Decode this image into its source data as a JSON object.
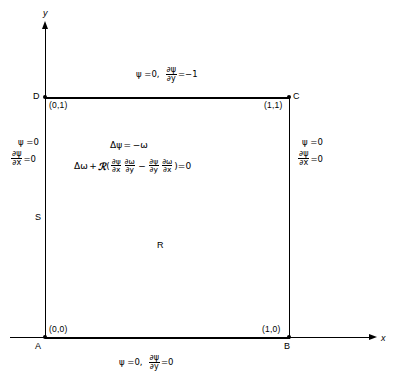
{
  "figure": {
    "type": "boundary-value-problem-diagram",
    "domain_shape": "unit-square",
    "axes": {
      "x_label": "x",
      "y_label": "y"
    },
    "vertices": [
      {
        "name": "A",
        "coord": "(0,0)"
      },
      {
        "name": "B",
        "coord": "(1,0)"
      },
      {
        "name": "C",
        "coord": "(1,1)"
      },
      {
        "name": "D",
        "coord": "(0,1)"
      }
    ],
    "region_label": "R",
    "boundary_label": "S",
    "interior_equations": {
      "poisson": {
        "laplacian": "Δ",
        "psi": "ψ",
        "equals": "=",
        "rhs": "−ω"
      },
      "vorticity_transport": {
        "laplacian": "Δ",
        "omega": "ω",
        "plus": "+",
        "reynolds": "ℛ",
        "open_paren": "(",
        "term1_num": "∂ψ",
        "term1_den": "∂x",
        "term2_num": "∂ω",
        "term2_den": "∂y",
        "minus": "−",
        "term3_num": "∂ψ",
        "term3_den": "∂y",
        "term4_num": "∂ω",
        "term4_den": "∂x",
        "close_paren": ")",
        "equals_zero": "=0"
      }
    },
    "boundary_conditions": {
      "top": {
        "psi_condition": "ψ =0,",
        "deriv_num": "∂ψ",
        "deriv_den": "∂y",
        "deriv_value": "=−1"
      },
      "bottom": {
        "psi_condition": "ψ =0,",
        "deriv_num": "∂ψ",
        "deriv_den": "∂y",
        "deriv_value": "=0"
      },
      "left": {
        "psi_condition": "ψ =0",
        "deriv_num": "∂ψ",
        "deriv_den": "∂x",
        "deriv_value": "=0"
      },
      "right": {
        "psi_condition": "ψ =0",
        "deriv_num": "∂ψ",
        "deriv_den": "∂x",
        "deriv_value": "=0"
      }
    },
    "colors": {
      "stroke": "#000000",
      "background": "#ffffff"
    }
  }
}
